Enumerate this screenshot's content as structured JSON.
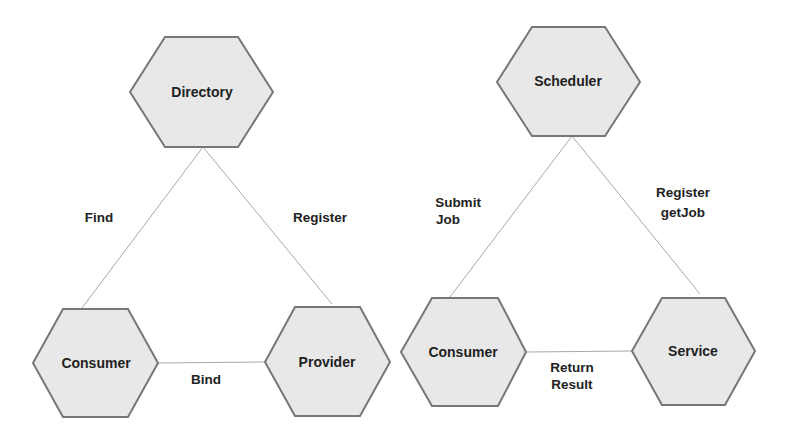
{
  "colors": {
    "node_fill": "#e8e8e8",
    "node_stroke": "#777777",
    "edge_stroke": "#a8a8a8",
    "text": "#222222",
    "background": "#ffffff"
  },
  "diagrams": [
    {
      "name": "service-directory-model",
      "nodes": {
        "top": {
          "label": "Directory"
        },
        "left": {
          "label": "Consumer"
        },
        "right": {
          "label": "Provider"
        }
      },
      "edges": {
        "left": {
          "lines": [
            "Find"
          ]
        },
        "right": {
          "lines": [
            "Register"
          ]
        },
        "bottom": {
          "lines": [
            "Bind"
          ]
        }
      }
    },
    {
      "name": "scheduler-model",
      "nodes": {
        "top": {
          "label": "Scheduler"
        },
        "left": {
          "label": "Consumer"
        },
        "right": {
          "label": "Service"
        }
      },
      "edges": {
        "left": {
          "lines": [
            "Submit",
            "Job"
          ]
        },
        "right": {
          "lines": [
            "Register",
            "getJob"
          ]
        },
        "bottom": {
          "lines": [
            "Return",
            "Result"
          ]
        }
      }
    }
  ]
}
